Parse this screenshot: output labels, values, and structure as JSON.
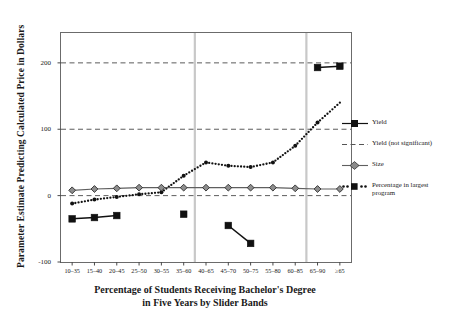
{
  "axes": {
    "ylabel": "Parameter Estimate Predicting Calculated Price in Dollars",
    "xlabel_line1": "Percentage of Students Receiving Bachelor's Degree",
    "xlabel_line2": "in Five Years by Slider Bands",
    "yticks": [
      "200",
      "100",
      "0",
      "-100"
    ],
    "ytick_values": [
      200,
      100,
      0,
      -100
    ],
    "ylim": [
      -100,
      245
    ],
    "gridlines": [
      200,
      100,
      0
    ],
    "band_separators": [
      "35-60",
      "60-85"
    ]
  },
  "chart_data": {
    "type": "line",
    "title": "",
    "xlabel": "Percentage of Students Receiving Bachelor's Degree in Five Years by Slider Bands",
    "ylabel": "Parameter Estimate Predicting Calculated Price in Dollars",
    "ylim": [
      -100,
      245
    ],
    "grid": true,
    "legend_position": "right",
    "categories": [
      "10–35",
      "15–40",
      "20–45",
      "25–50",
      "30–55",
      "35–60",
      "40–65",
      "45–70",
      "50–75",
      "55–80",
      "60–85",
      "65–90",
      "≥65"
    ],
    "series": [
      {
        "name": "Yield",
        "style": "solid-square",
        "color": "#111111",
        "values": [
          -35,
          -33,
          -30,
          null,
          null,
          -28,
          null,
          -45,
          -72,
          null,
          null,
          193,
          195
        ],
        "segments": [
          [
            0,
            1,
            2
          ],
          [
            7,
            8
          ],
          [
            11,
            12
          ]
        ]
      },
      {
        "name": "Yield (not significant)",
        "style": "dashed",
        "color": "#555555",
        "values": [
          null,
          null,
          null,
          null,
          null,
          null,
          null,
          null,
          null,
          null,
          null,
          null,
          null
        ]
      },
      {
        "name": "Size",
        "style": "solid-diamond",
        "color": "#6e6e6e",
        "values": [
          8,
          10,
          11,
          12,
          12,
          12,
          12,
          12,
          12,
          12,
          11,
          10,
          10
        ]
      },
      {
        "name": "Percentage in largest program",
        "style": "dotted-smalldot",
        "color": "#111111",
        "values": [
          -12,
          -6,
          -2,
          2,
          5,
          30,
          50,
          45,
          43,
          50,
          75,
          110,
          null
        ]
      }
    ]
  },
  "legend": {
    "items": [
      {
        "label": "Yield",
        "key": "solid-square-key"
      },
      {
        "label": "Yield (not significant)",
        "key": "dashed-line-key"
      },
      {
        "label": "Size",
        "key": "solid-diamond-key"
      },
      {
        "label": "Percentage in largest program",
        "key": "dotted-dot-key"
      }
    ]
  }
}
